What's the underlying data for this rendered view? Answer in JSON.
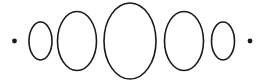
{
  "figure": {
    "description": "A horizontal row of five outlined ellipses increasing then decreasing in size, flanked by a small filled dot on each end.",
    "canvas": {
      "width": 265,
      "height": 81,
      "background_color": "#ffffff"
    },
    "style": {
      "stroke_color": "#1a1a1a",
      "stroke_width": 1.6,
      "fill": "none",
      "dot_color": "#1a1a1a"
    }
  },
  "chart_data": {
    "type": "scatter",
    "xlabel": "",
    "ylabel": "",
    "grid": false,
    "legend": null,
    "xlim": [
      0,
      265
    ],
    "ylim": [
      0,
      81
    ],
    "baseline_y": 41,
    "categories": [
      "dot-left",
      "ellipse-1",
      "ellipse-2",
      "ellipse-3",
      "ellipse-4",
      "ellipse-5",
      "dot-right"
    ],
    "values": [
      2,
      11,
      19,
      26,
      19,
      11,
      2
    ],
    "series": [
      {
        "name": "semi-axis-x",
        "values": [
          2,
          11.5,
          19.5,
          26,
          19.5,
          11.5,
          2
        ]
      },
      {
        "name": "semi-axis-y",
        "values": [
          2,
          19,
          29.5,
          38,
          29.5,
          19,
          2
        ]
      }
    ],
    "marks": [
      {
        "name": "dot-left",
        "kind": "dot",
        "cx": 14.5,
        "cy": 41,
        "r": 2.4,
        "filled": true
      },
      {
        "name": "ellipse-1",
        "kind": "ellipse",
        "cx": 40.5,
        "cy": 41,
        "rx": 11.5,
        "ry": 19,
        "filled": false
      },
      {
        "name": "ellipse-2",
        "kind": "ellipse",
        "cx": 77,
        "cy": 41,
        "rx": 19.5,
        "ry": 29.5,
        "filled": false
      },
      {
        "name": "ellipse-3",
        "kind": "ellipse",
        "cx": 130,
        "cy": 41,
        "rx": 26,
        "ry": 38,
        "filled": false
      },
      {
        "name": "ellipse-4",
        "kind": "ellipse",
        "cx": 184,
        "cy": 41,
        "rx": 19.5,
        "ry": 29.5,
        "filled": false
      },
      {
        "name": "ellipse-5",
        "kind": "ellipse",
        "cx": 223,
        "cy": 41,
        "rx": 11.5,
        "ry": 19,
        "filled": false
      },
      {
        "name": "dot-right",
        "kind": "dot",
        "cx": 250,
        "cy": 41,
        "r": 2.4,
        "filled": true
      }
    ]
  }
}
